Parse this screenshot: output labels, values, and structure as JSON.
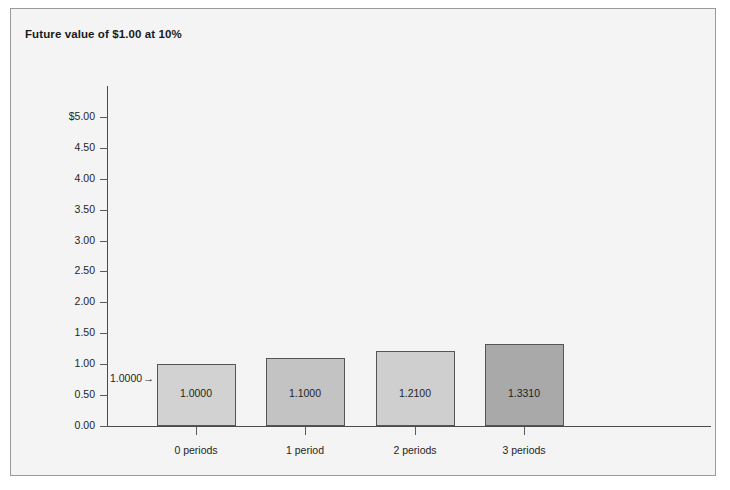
{
  "figure": {
    "title": "Future value of $1.00 at 10%",
    "background_color": "#f4f4f4",
    "border_color": "#9a9a9a"
  },
  "annotation": {
    "label": "1.0000",
    "arrow": "→"
  },
  "chart_data": {
    "type": "bar",
    "title": "Future value of $1.00 at 10%",
    "xlabel": "",
    "ylabel": "",
    "categories": [
      "0 periods",
      "1 period",
      "2 periods",
      "3 periods"
    ],
    "values": [
      1.0,
      1.1,
      1.21,
      1.331
    ],
    "value_labels": [
      "1.0000",
      "1.1000",
      "1.2100",
      "1.3310"
    ],
    "bar_colors": [
      "#d2d2d2",
      "#c3c3c3",
      "#cfcfcf",
      "#a9a9a9"
    ],
    "bar_border_color": "#555555",
    "ylim": [
      0.0,
      5.5
    ],
    "ytick_values": [
      0.0,
      0.5,
      1.0,
      1.5,
      2.0,
      2.5,
      3.0,
      3.5,
      4.0,
      4.5,
      5.0
    ],
    "ytick_labels": [
      "0.00",
      "0.50",
      "1.00",
      "1.50",
      "2.00",
      "2.50",
      "3.00",
      "3.50",
      "4.00",
      "4.50",
      "$5.00"
    ],
    "grid": false,
    "legend": null,
    "annotations": [
      {
        "text": "1.0000",
        "points_to_category": "0 periods",
        "points_to_value": 1.0
      }
    ]
  }
}
